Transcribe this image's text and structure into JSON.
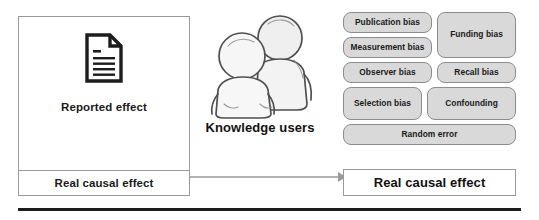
{
  "diagram": {
    "left_panel": {
      "icon": "document-icon",
      "reported_effect_label": "Reported effect",
      "real_causal_effect_label": "Real causal effect"
    },
    "center": {
      "icon": "two-people-icon",
      "label": "Knowledge users"
    },
    "connector": {
      "icon": "arrow-right-icon"
    },
    "right_panel": {
      "biases": [
        {
          "label": "Publication bias"
        },
        {
          "label": "Measurement bias"
        },
        {
          "label": "Funding bias"
        },
        {
          "label": "Observer bias"
        },
        {
          "label": "Recall bias"
        },
        {
          "label": "Selection bias"
        },
        {
          "label": "Confounding"
        },
        {
          "label": "Random error"
        }
      ],
      "real_causal_effect_label": "Real causal effect"
    },
    "colors": {
      "pill_fill": "#d9d9d9",
      "pill_border": "#8c8c8c",
      "box_border": "#9a9a9a",
      "rule": "#1d1d1d",
      "text": "#1a1a1a"
    }
  }
}
